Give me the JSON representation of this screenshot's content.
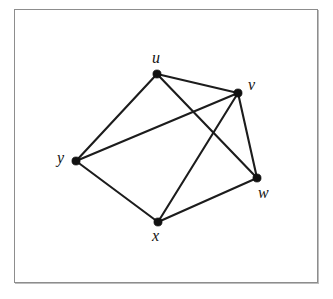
{
  "figure": {
    "type": "undirected-graph-diagram",
    "background_color": "#ffffff",
    "frame_color": "#8d8d8d",
    "edge_color": "#1c1c1c",
    "vertex_color": "#111111",
    "label_color": "#121212"
  },
  "graph": {
    "vertex_count": 5,
    "edge_count": 8,
    "vertices": [
      {
        "id": "u",
        "label": "u",
        "x": 157,
        "y": 74,
        "label_x": 152,
        "label_y": 50,
        "degree": 3
      },
      {
        "id": "v",
        "label": "v",
        "x": 238,
        "y": 93,
        "label_x": 248,
        "label_y": 77,
        "degree": 4
      },
      {
        "id": "w",
        "label": "w",
        "x": 257,
        "y": 178,
        "label_x": 258,
        "label_y": 185,
        "degree": 3
      },
      {
        "id": "x",
        "label": "x",
        "x": 158,
        "y": 222,
        "label_x": 152,
        "label_y": 228,
        "degree": 3
      },
      {
        "id": "y",
        "label": "y",
        "x": 76,
        "y": 161,
        "label_x": 57,
        "label_y": 150,
        "degree": 3
      }
    ],
    "edges": [
      {
        "id": "edge-u-v",
        "from": "u",
        "to": "v"
      },
      {
        "id": "edge-u-w",
        "from": "u",
        "to": "w"
      },
      {
        "id": "edge-u-y",
        "from": "u",
        "to": "y"
      },
      {
        "id": "edge-v-w",
        "from": "v",
        "to": "w"
      },
      {
        "id": "edge-v-x",
        "from": "v",
        "to": "x"
      },
      {
        "id": "edge-v-y",
        "from": "v",
        "to": "y"
      },
      {
        "id": "edge-w-x",
        "from": "w",
        "to": "x"
      },
      {
        "id": "edge-x-y",
        "from": "x",
        "to": "y"
      }
    ]
  }
}
